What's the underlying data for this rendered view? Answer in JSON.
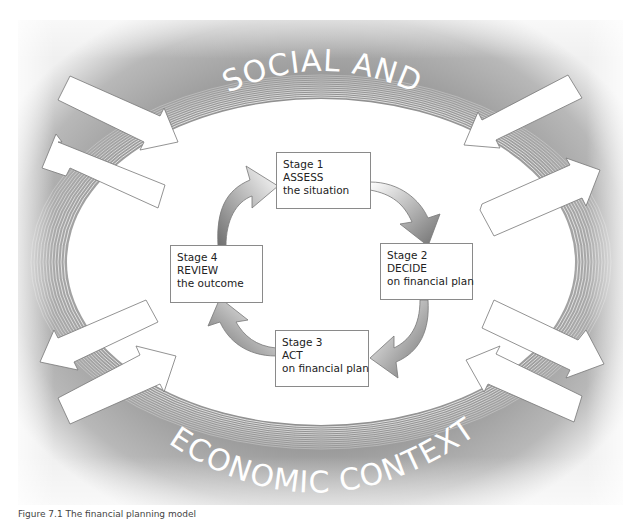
{
  "figure": {
    "caption": "Figure 7.1 The financial planning model",
    "context_label_top": "SOCIAL AND",
    "context_label_bottom": "ECONOMIC CONTEXT",
    "colors": {
      "panel_dark": "#8c8c8c",
      "panel_light": "#f2f2f2",
      "box_border": "#8a8a8a",
      "ellipse_fill": "#ffffff"
    }
  },
  "stages": [
    {
      "stage": "Stage 1",
      "action": "ASSESS",
      "detail": "the situation"
    },
    {
      "stage": "Stage 2",
      "action": "DECIDE",
      "detail": "on financial plan"
    },
    {
      "stage": "Stage 3",
      "action": "ACT",
      "detail": "on financial plan"
    },
    {
      "stage": "Stage 4",
      "action": "REVIEW",
      "detail": "the outcome"
    }
  ],
  "cycle_arrows": [
    {
      "from": "Stage 4",
      "to": "Stage 1"
    },
    {
      "from": "Stage 1",
      "to": "Stage 2"
    },
    {
      "from": "Stage 2",
      "to": "Stage 3"
    },
    {
      "from": "Stage 3",
      "to": "Stage 4"
    }
  ],
  "context_arrows": [
    {
      "position": "upper-left",
      "directions": [
        "inward",
        "outward"
      ]
    },
    {
      "position": "upper-right",
      "directions": [
        "inward",
        "outward"
      ]
    },
    {
      "position": "lower-left",
      "directions": [
        "outward",
        "inward"
      ]
    },
    {
      "position": "lower-right",
      "directions": [
        "outward",
        "inward"
      ]
    }
  ]
}
